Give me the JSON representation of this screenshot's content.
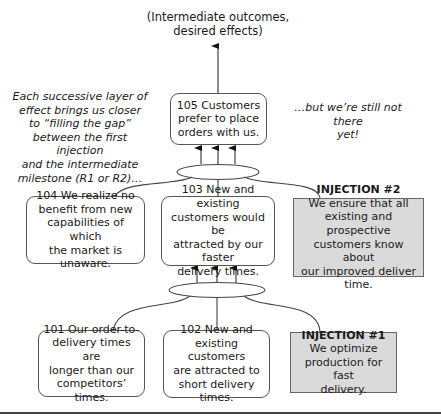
{
  "header": {
    "label_line1": "(Intermediate outcomes,",
    "label_line2": "desired effects)"
  },
  "notes": {
    "left": [
      "Each successive layer of",
      "effect brings us closer",
      "to “filling the gap”",
      "between the first injection",
      "and the intermediate",
      "milestone (R1 or R2)…"
    ],
    "right": [
      "…but we’re still not there",
      "yet!"
    ]
  },
  "nodes": {
    "n105": {
      "lines": [
        "105 Customers",
        "prefer to place",
        "orders with us."
      ]
    },
    "n104": {
      "lines": [
        "104 We realize no",
        "benefit from new",
        "capabilities of which",
        "the market is unaware."
      ]
    },
    "n103": {
      "lines": [
        "103 New and existing",
        "customers would be",
        "attracted by our faster",
        "delivery times."
      ]
    },
    "n101": {
      "lines": [
        "101 Our order-to-",
        "delivery times are",
        "longer than our",
        "competitors’ times."
      ]
    },
    "n102": {
      "lines": [
        "102 New and",
        "existing customers",
        "are attracted to",
        "short delivery times."
      ]
    }
  },
  "injections": {
    "inj2": {
      "title": "INJECTION #2",
      "lines": [
        "We ensure that all",
        "existing and prospective",
        "customers know about",
        "our improved deliver time."
      ]
    },
    "inj1": {
      "title": "INJECTION #1",
      "lines": [
        "We optimize",
        "production for fast",
        "delivery."
      ]
    }
  },
  "colors": {
    "injection_fill": "#dadada",
    "line": "#555555"
  }
}
